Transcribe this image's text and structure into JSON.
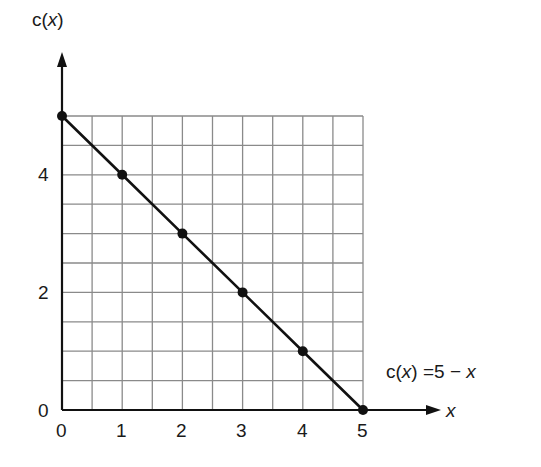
{
  "chart_data": {
    "type": "line",
    "title": "",
    "xlabel": "x",
    "ylabel": "c(x)",
    "equation_label": "c(x) = 5 − x",
    "x": [
      0,
      1,
      2,
      3,
      4,
      5
    ],
    "series": [
      {
        "name": "c(x) = 5 − x",
        "values": [
          5,
          4,
          3,
          2,
          1,
          0
        ],
        "markers": true
      }
    ],
    "xlim": [
      0,
      5
    ],
    "ylim": [
      0,
      5
    ],
    "x_ticks": [
      "0",
      "1",
      "2",
      "3",
      "4",
      "5"
    ],
    "y_ticks": [
      "0",
      "2",
      "4"
    ],
    "grid": true,
    "grid_step": 0.5,
    "colors": {
      "line": "#111111",
      "grid": "#8a8a8a",
      "axis": "#111111"
    }
  },
  "labels": {
    "y_axis_prefix": "c(",
    "y_axis_var": "x",
    "y_axis_suffix": ")",
    "x_axis_var": "x",
    "eq_prefix": "c(",
    "eq_var": "x",
    "eq_mid": ") =5 − ",
    "eq_var2": "x",
    "y0": "0",
    "y2": "2",
    "y4": "4",
    "x0": "0",
    "x1": "1",
    "x2": "2",
    "x3": "3",
    "x4": "4",
    "x5": "5"
  }
}
